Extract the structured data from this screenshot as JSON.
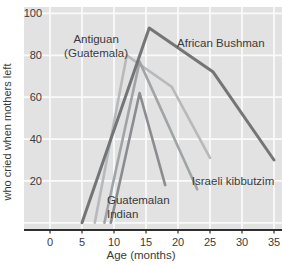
{
  "axes": {
    "x_label": "Age (months)",
    "y_label": "who cried when mothers left"
  },
  "chart_data": {
    "type": "line",
    "title": "",
    "xlabel": "Age (months)",
    "ylabel": "who cried when mothers left",
    "xlim": [
      0,
      35
    ],
    "ylim": [
      0,
      100
    ],
    "grid": true,
    "legend_position": "inline-annotations",
    "x_ticks": [
      0,
      5,
      10,
      15,
      20,
      25,
      30,
      35
    ],
    "y_gridlines": [
      0,
      20,
      40,
      60,
      80,
      100
    ],
    "y_tick_labels": [
      20,
      40,
      60,
      80,
      100
    ],
    "series": [
      {
        "name": "Antiguan (Guatemala)",
        "color": "#b4b6b8",
        "width": 2.6,
        "points": [
          [
            7,
            0
          ],
          [
            12,
            80
          ],
          [
            19,
            65
          ],
          [
            25,
            31
          ]
        ]
      },
      {
        "name": "Israeli kibbutzim",
        "color": "#9da0a2",
        "width": 2.6,
        "points": [
          [
            8.5,
            0
          ],
          [
            14,
            77
          ],
          [
            23,
            16
          ]
        ]
      },
      {
        "name": "Guatemalan Indian",
        "color": "#85878a",
        "width": 2.6,
        "points": [
          [
            9.5,
            0
          ],
          [
            14,
            62
          ],
          [
            18,
            18
          ]
        ]
      },
      {
        "name": "African Bushman",
        "color": "#6d6f71",
        "width": 3,
        "points": [
          [
            5,
            0
          ],
          [
            15.5,
            93
          ],
          [
            25.5,
            72
          ],
          [
            35,
            30
          ]
        ]
      }
    ],
    "annotations": [
      {
        "text": "Antiguan",
        "text2": "(Guatemala)",
        "x": 7.2,
        "y": 88,
        "anchor": "middle"
      },
      {
        "text": "African Bushman",
        "text2": "",
        "x": 26.7,
        "y": 86,
        "anchor": "middle"
      },
      {
        "text": "Guatemalan",
        "text2": "Indian",
        "x": 8.9,
        "y": 11,
        "anchor": "start"
      },
      {
        "text": "Israeli kibbutzim",
        "text2": "",
        "x": 28.6,
        "y": 20,
        "anchor": "middle"
      }
    ]
  },
  "colors": {
    "page_bg": "#ffffff",
    "plot_bg": "#e2e2e2",
    "grid": "#fafafa",
    "axis": "#2e2e2e",
    "text": "#3a3a3a"
  }
}
